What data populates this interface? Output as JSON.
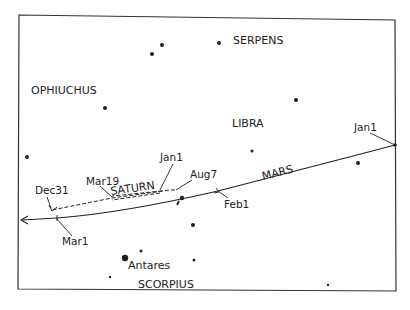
{
  "diagram": {
    "colors": {
      "ink": "#222222",
      "background": "#ffffff"
    },
    "constellations": [
      {
        "name": "SERPENS",
        "x": 233,
        "y": 44
      },
      {
        "name": "OPHIUCHUS",
        "x": 31,
        "y": 94
      },
      {
        "name": "LIBRA",
        "x": 232,
        "y": 127
      },
      {
        "name": "SCORPIUS",
        "x": 138,
        "y": 288
      }
    ],
    "stars": [
      {
        "x": 162,
        "y": 45,
        "r": 2
      },
      {
        "x": 152,
        "y": 54,
        "r": 2
      },
      {
        "x": 219,
        "y": 43,
        "r": 2
      },
      {
        "x": 105,
        "y": 108,
        "r": 2
      },
      {
        "x": 296,
        "y": 100,
        "r": 2
      },
      {
        "x": 27,
        "y": 157,
        "r": 2
      },
      {
        "x": 252,
        "y": 151,
        "r": 1.5
      },
      {
        "x": 358,
        "y": 163,
        "r": 2
      },
      {
        "x": 182,
        "y": 198,
        "r": 2.2
      },
      {
        "x": 193,
        "y": 225,
        "r": 2
      },
      {
        "x": 141,
        "y": 251,
        "r": 1.5
      },
      {
        "x": 194,
        "y": 260,
        "r": 1.5
      },
      {
        "x": 110,
        "y": 277,
        "r": 1.2
      },
      {
        "x": 328,
        "y": 285,
        "r": 1.2
      }
    ],
    "named_star": {
      "name": "Antares",
      "x": 125,
      "y": 258
    },
    "planets": [
      {
        "name": "MARS",
        "label_x": 263,
        "label_y": 180,
        "rotate": -14
      },
      {
        "name": "SATURN",
        "label_x": 111,
        "label_y": 195,
        "rotate": -8
      }
    ],
    "date_labels": [
      {
        "text": "Jan1",
        "x": 354,
        "y": 131,
        "planet": "MARS"
      },
      {
        "text": "Feb1",
        "x": 224,
        "y": 208,
        "planet": "MARS"
      },
      {
        "text": "Mar1",
        "x": 62,
        "y": 245,
        "planet": "MARS"
      },
      {
        "text": "Jan1",
        "x": 160,
        "y": 161,
        "planet": "SATURN"
      },
      {
        "text": "Aug7",
        "x": 190,
        "y": 178,
        "planet": "SATURN"
      },
      {
        "text": "Mar19",
        "x": 86,
        "y": 185,
        "planet": "SATURN"
      },
      {
        "text": "Dec31",
        "x": 35,
        "y": 194,
        "planet": "SATURN"
      }
    ]
  }
}
